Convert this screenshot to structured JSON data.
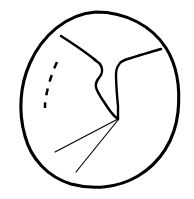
{
  "figure": {
    "title": "Line drawing diagram",
    "canvas": {
      "width": 194,
      "height": 199,
      "background_color": "#ffffff"
    },
    "ink_color": "#000000",
    "elements": [
      {
        "name": "outer-outline",
        "role": "boundary",
        "style": "solid",
        "stroke_width": 3.1,
        "bounds": {
          "left": 22,
          "top": 12,
          "right": 180,
          "bottom": 187
        },
        "path": "M 96 12 C 126 12 152 26 166 48 C 178 67 180 92 178 112 C 175 140 160 163 138 176 C 118 188 93 190 71 184 C 48 177 31 159 25 136 C 18 112 20 85 30 63 C 42 36 66 14 96 12 Z"
      },
      {
        "name": "left-branch-line",
        "role": "internal-ridge",
        "style": "solid",
        "stroke_width": 2.5,
        "from": [
          62,
          37
        ],
        "to": [
          99,
          63
        ],
        "path": "M 61 36 C 72 43 84 51 94 59 C 96 61 98 62 100 64"
      },
      {
        "name": "right-branch-line",
        "role": "internal-ridge",
        "style": "solid",
        "stroke_width": 2.5,
        "from": [
          160,
          48
        ],
        "to": [
          122,
          61
        ],
        "path": "M 161 49 C 151 52 140 55 131 58 C 127 59 124 60 121 62"
      },
      {
        "name": "central-channel-left-wall",
        "role": "channel-edge",
        "style": "solid",
        "stroke_width": 2.4,
        "path": "M 100 64 C 102 67 103 71 101 75 C 98 79 95 82 96 87 C 97 93 103 100 108 108 C 112 114 115 117 118 119"
      },
      {
        "name": "central-channel-right-wall",
        "role": "channel-edge",
        "style": "solid",
        "stroke_width": 2.4,
        "path": "M 121 62 C 118 65 116 69 116 74 C 116 84 117 96 118 106 C 118 112 118 116 118 119"
      },
      {
        "name": "dashed-arc",
        "role": "dashed-marker",
        "style": "dashed",
        "stroke_width": 2.5,
        "dash_pattern": "7 7",
        "dash_count": 4,
        "path": "M 57 62 C 52 73 48 85 46 97 C 45 102 45 105 45 108"
      },
      {
        "name": "radiating-line-upper",
        "role": "thin-radiating-line",
        "style": "solid",
        "stroke_width": 1.15,
        "from": [
          118,
          119
        ],
        "to": [
          55,
          152
        ]
      },
      {
        "name": "radiating-line-lower",
        "role": "thin-radiating-line",
        "style": "solid",
        "stroke_width": 1.15,
        "from": [
          118,
          120
        ],
        "to": [
          76,
          172
        ]
      }
    ],
    "convergence_point": [
      118,
      119
    ]
  }
}
